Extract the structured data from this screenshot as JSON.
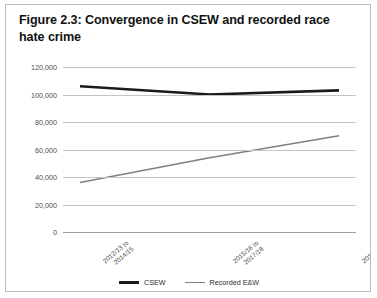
{
  "figure": {
    "title": "Figure 2.3: Convergence in CSEW and recorded race hate crime"
  },
  "legend": {
    "position": "bottom-center",
    "items": [
      {
        "label": "CSEW",
        "color": "#1a1a1a"
      },
      {
        "label": "Recorded E&W",
        "color": "#808080"
      }
    ]
  },
  "chart_data": {
    "type": "line",
    "title": "Figure 2.3: Convergence in CSEW and recorded race hate crime",
    "xlabel": "",
    "ylabel": "",
    "categories": [
      "2012/13 to 2014/15",
      "2015/16 to 2017/18",
      "2017/18 to 2019/20"
    ],
    "series": [
      {
        "name": "CSEW",
        "color": "#1a1a1a",
        "values": [
          106000,
          100000,
          103000
        ]
      },
      {
        "name": "Recorded E&W",
        "color": "#808080",
        "values": [
          36000,
          54000,
          70000
        ]
      }
    ],
    "ylim": [
      0,
      120000
    ],
    "yticks": [
      0,
      20000,
      40000,
      60000,
      80000,
      100000,
      120000
    ],
    "ytick_labels": [
      "0",
      "20,000",
      "40,000",
      "60,000",
      "80,000",
      "100,000",
      "120,000"
    ],
    "grid": true,
    "grid_axis": "y"
  }
}
